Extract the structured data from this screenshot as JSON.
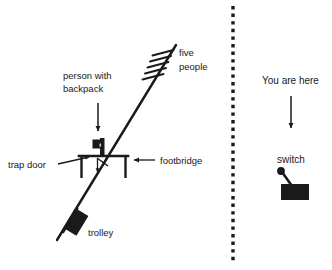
{
  "scene": {
    "title": "trolley-problem-footbridge-diagram",
    "background_color": "#ffffff",
    "ink_color": "#1a1a1a",
    "width": 332,
    "height": 270
  },
  "left_panel": {
    "labels": {
      "five_people_line1": "five",
      "five_people_line2": "people",
      "person_with_backpack_line1": "person with",
      "person_with_backpack_line2": "backpack",
      "trap_door": "trap door",
      "footbridge": "footbridge",
      "trolley": "trolley"
    },
    "elements": {
      "track": "diagonal-track-line",
      "people_marks": "five-hatch-marks",
      "bridge": "footbridge-structure",
      "figure": "person-with-backpack-figure",
      "trapdoor": "trap-door-hinge",
      "trolley_body": "trolley-block",
      "trolley_motion": "trolley-direction-arrow"
    }
  },
  "divider": {
    "style": "vertical-dotted-line",
    "x": 233
  },
  "right_panel": {
    "labels": {
      "you_are_here": "You are here",
      "switch": "switch"
    },
    "elements": {
      "pointer": "downward-arrow",
      "switch_graphic": "lever-switch"
    }
  }
}
